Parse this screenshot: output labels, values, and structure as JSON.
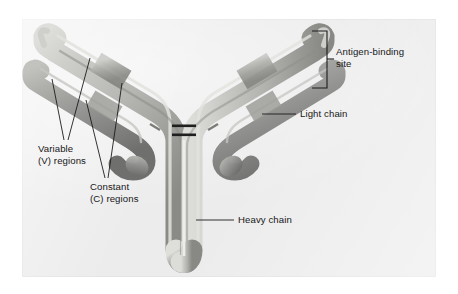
{
  "figure": {
    "plate_background": "#ececed",
    "page_background": "#ffffff",
    "ink_color": "#171717"
  },
  "labels": {
    "antigen_binding_site": "Antigen-binding\nsite",
    "light_chain": "Light chain",
    "heavy_chain": "Heavy chain",
    "variable_regions": "Variable\n(V) regions",
    "constant_regions": "Constant\n(C) regions"
  },
  "structure": {
    "heavy_chain_color": "#b9b9b6",
    "light_chain_color": "#8d8d8a",
    "variable_segment_color": "#c9c9c6",
    "constant_segment_color": "#a2a29f",
    "disulfide_bond_color": "#2a2a2a",
    "parts": [
      "heavy-chain-left",
      "heavy-chain-right",
      "light-chain-left",
      "light-chain-right",
      "hinge-disulfide-bonds",
      "fc-stem"
    ]
  }
}
